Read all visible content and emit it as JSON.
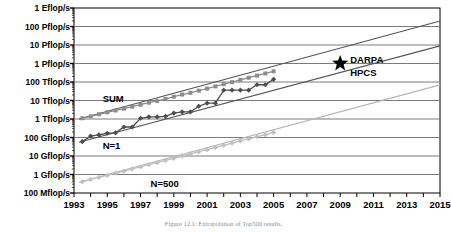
{
  "chart_data": {
    "type": "line",
    "title": "",
    "xlabel": "",
    "ylabel": "",
    "grid": true,
    "legend_position": "inline-annotation",
    "xlim": [
      1993,
      2015
    ],
    "ylim_log_flops": [
      100000000.0,
      1e+18
    ],
    "y_tick_labels": [
      "1 Eflop/s",
      "100 Pflop/s",
      "10 Pflop/s",
      "1 Pflop/s",
      "100 Tflop/s",
      "10 Tflop/s",
      "1 Tflop/s",
      "100 Gflop/s",
      "10 Gflop/s",
      "1 Gflop/s",
      "100 Mflop/s"
    ],
    "y_tick_values": [
      1e+18,
      1e+17,
      1e+16,
      1000000000000000.0,
      100000000000000.0,
      10000000000000.0,
      1000000000000.0,
      100000000000.0,
      10000000000.0,
      1000000000.0,
      100000000.0
    ],
    "x_tick_labels": [
      "1993",
      "1995",
      "1997",
      "1999",
      "2001",
      "2003",
      "2005",
      "2007",
      "2009",
      "2011",
      "2013",
      "2015"
    ],
    "x_tick_values": [
      1993,
      1995,
      1997,
      1999,
      2001,
      2003,
      2005,
      2007,
      2009,
      2011,
      2013,
      2015
    ],
    "series": [
      {
        "name": "SUM",
        "color": "#8c8c8c",
        "marker": "square",
        "x": [
          1993.5,
          1994.0,
          1994.5,
          1995.0,
          1995.5,
          1996.0,
          1996.5,
          1997.0,
          1997.5,
          1998.0,
          1998.5,
          1999.0,
          1999.5,
          2000.0,
          2000.5,
          2001.0,
          2001.5,
          2002.0,
          2002.5,
          2003.0,
          2003.5,
          2004.0,
          2004.5,
          2005.0
        ],
        "values": [
          1100000000000.0,
          1400000000000.0,
          1800000000000.0,
          2300000000000.0,
          2900000000000.0,
          3600000000000.0,
          4600000000000.0,
          5900000000000.0,
          7600000000000.0,
          9500000000000.0,
          12000000000000.0,
          16000000000000.0,
          21000000000000.0,
          26000000000000.0,
          34000000000000.0,
          44000000000000.0,
          58000000000000.0,
          76000000000000.0,
          98000000000000.0,
          130000000000000.0,
          170000000000000.0,
          220000000000000.0,
          290000000000000.0,
          380000000000000.0
        ]
      },
      {
        "name": "N=1",
        "color": "#4d4d4d",
        "marker": "diamond",
        "x": [
          1993.5,
          1994.0,
          1994.5,
          1995.0,
          1995.5,
          1996.0,
          1996.5,
          1997.0,
          1997.5,
          1998.0,
          1998.5,
          1999.0,
          1999.5,
          2000.0,
          2000.5,
          2001.0,
          2001.5,
          2002.0,
          2002.5,
          2003.0,
          2003.5,
          2004.0,
          2004.5,
          2005.0
        ],
        "values": [
          60000000000.0,
          120000000000.0,
          140000000000.0,
          170000000000.0,
          180000000000.0,
          370000000000.0,
          370000000000.0,
          1100000000000.0,
          1300000000000.0,
          1300000000000.0,
          1400000000000.0,
          2100000000000.0,
          2400000000000.0,
          2400000000000.0,
          4900000000000.0,
          7200000000000.0,
          7200000000000.0,
          36000000000000.0,
          36000000000000.0,
          36000000000000.0,
          36000000000000.0,
          71000000000000.0,
          71000000000000.0,
          140000000000000.0
        ]
      },
      {
        "name": "N=500",
        "color": "#bfbfbf",
        "marker": "diamond",
        "x": [
          1993.5,
          1994.0,
          1994.5,
          1995.0,
          1995.5,
          1996.0,
          1996.5,
          1997.0,
          1997.5,
          1998.0,
          1998.5,
          1999.0,
          1999.5,
          2000.0,
          2000.5,
          2001.0,
          2001.5,
          2002.0,
          2002.5,
          2003.0,
          2003.5,
          2004.0,
          2004.5,
          2005.0
        ],
        "values": [
          400000000.0,
          550000000.0,
          700000000.0,
          900000000.0,
          1200000000.0,
          1500000000.0,
          2000000000.0,
          2600000000.0,
          3400000000.0,
          4400000000.0,
          5800000000.0,
          7500000000.0,
          10000000000.0,
          13000000000.0,
          17000000000.0,
          22000000000.0,
          29000000000.0,
          38000000000.0,
          50000000000.0,
          65000000000.0,
          85000000000.0,
          110000000000.0,
          140000000000.0,
          190000000000.0
        ]
      }
    ],
    "trendlines": [
      {
        "name": "SUM-trend",
        "color": "#555555",
        "x": [
          1993.3,
          2015
        ],
        "values": [
          1000000000000.0,
          2e+17
        ]
      },
      {
        "name": "N1-trend",
        "color": "#555555",
        "x": [
          1993.3,
          2015
        ],
        "values": [
          55000000000.0,
          9000000000000000.0
        ]
      },
      {
        "name": "N500-trend",
        "color": "#b5b5b5",
        "x": [
          1993.3,
          2015
        ],
        "values": [
          380000000.0,
          70000000000000.0
        ]
      }
    ],
    "annotations": [
      {
        "name": "darpa-star",
        "label": "DARPA",
        "sublabel": "HPCS",
        "x": 2009.0,
        "y": 1000000000000000.0,
        "marker": "star",
        "color": "#000000"
      }
    ]
  },
  "labels": {
    "sum": "SUM",
    "n1": "N=1",
    "n500": "N=500",
    "darpa": "DARPA",
    "hpcs": "HPCS"
  },
  "caption": {
    "text": "Figure 12.1: Extrapolation of Top500 results."
  }
}
